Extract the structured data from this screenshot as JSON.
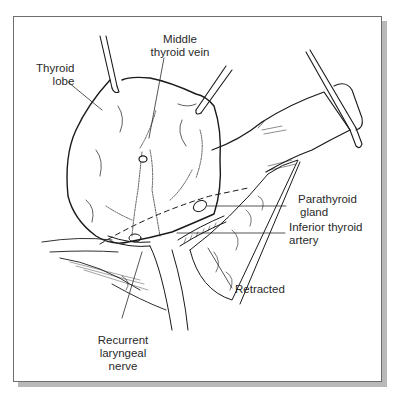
{
  "figure": {
    "colors": {
      "line": "#1a1a1a",
      "frame": "#6e6e6e",
      "shadow": "#b9b9b9",
      "background": "#ffffff"
    },
    "labels": {
      "thyroid_lobe": {
        "line1": "Thyroid",
        "line2": "lobe"
      },
      "middle_thyroid_vein": {
        "line1": "Middle",
        "line2": "thyroid vein"
      },
      "parathyroid_gland": {
        "line1": "Parathyroid",
        "line2": "gland"
      },
      "inferior_thyroid_artery": {
        "line1": "Inferior thyroid",
        "line2": "artery"
      },
      "retracted": {
        "line1": "Retracted"
      },
      "recurrent_laryngeal_nerve": {
        "line1": "Recurrent",
        "line2": "laryngeal",
        "line3": "nerve"
      }
    }
  }
}
